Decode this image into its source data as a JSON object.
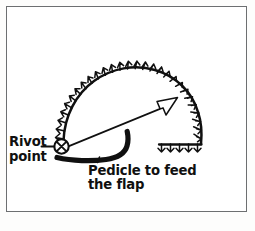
{
  "figure": {
    "background_color": "#ffffff",
    "ink_color": "#101010",
    "frame_color": "#6d6f71"
  },
  "labels": {
    "pivot": {
      "line1": "Rivot",
      "line2": "point"
    },
    "pedicle": {
      "line1": "Pedicle to feed",
      "line2": "the flap"
    }
  },
  "markers": {
    "pivot_point_symbol": "circle-x",
    "direction_arrow": "hollow-arrow-up-right",
    "flap_margin_hatching": "crows-foot-ticks",
    "pedicle_stroke": "thick-black-curve"
  },
  "geometry": {
    "arc_center_x": 131,
    "arc_center_y": 144,
    "arc_radius": 68,
    "arc_start_deg": 183,
    "arc_end_deg": 357,
    "hatch_count_arc": 25,
    "hatch_count_baseline": 5,
    "baseline_x_start": 159,
    "baseline_x_end": 205,
    "baseline_y": 144,
    "pivot_x": 61,
    "pivot_y": 146,
    "arrow_tip_x": 177,
    "arrow_tip_y": 97
  }
}
